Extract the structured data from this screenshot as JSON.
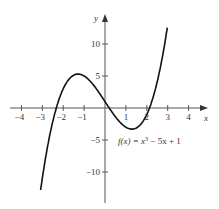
{
  "chart_data": {
    "type": "line",
    "title": "",
    "function_label": "f(x) = x³ − 5x + 1",
    "function_label_parts": {
      "prefix": "f(x) = x",
      "sup": "3",
      "suffix": " − 5x + 1"
    },
    "xlabel": "x",
    "ylabel": "y",
    "xlim": [
      -4.5,
      4.5
    ],
    "ylim": [
      -15,
      15
    ],
    "x_ticks": [
      -4,
      -3,
      -2,
      -1,
      1,
      2,
      3,
      4
    ],
    "x_tick_labels": [
      "−4",
      "−3",
      "−2",
      "−1",
      "1",
      "2",
      "3",
      "4"
    ],
    "y_ticks": [
      10,
      5,
      -5,
      -10
    ],
    "y_tick_labels": [
      "10",
      "5",
      "−5",
      "−10"
    ],
    "grid": false,
    "series": [
      {
        "name": "f(x) = x^3 - 5x + 1",
        "x": [
          -3.0,
          -2.5,
          -2.0,
          -1.29,
          -1.0,
          0.0,
          1.0,
          1.29,
          2.0,
          2.5,
          3.0
        ],
        "values": [
          -11,
          -2.125,
          3,
          5.3,
          5,
          1,
          -3,
          -3.3,
          -1,
          4.125,
          13
        ]
      }
    ]
  }
}
